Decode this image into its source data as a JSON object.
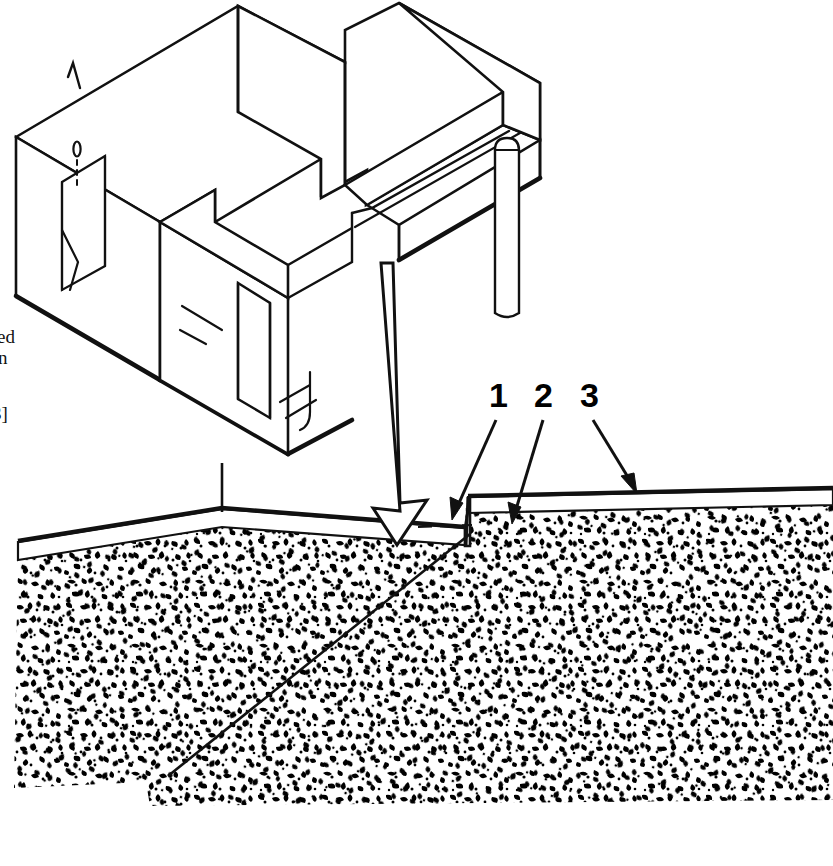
{
  "figure": {
    "line_color": "#111111",
    "fill_color": "#ffffff",
    "soil_color": "#000000",
    "background": "#ffffff"
  },
  "callouts": [
    {
      "id": "callout-1",
      "label": "1",
      "x": 497,
      "y": 392,
      "target": "under-slab base course / fill"
    },
    {
      "id": "callout-2",
      "label": "2",
      "x": 543,
      "y": 392,
      "target": "slab step riser"
    },
    {
      "id": "callout-3",
      "label": "3",
      "x": 589,
      "y": 392,
      "target": "upper slab surface"
    }
  ],
  "margin_text": [
    {
      "id": "margin-text-1",
      "value": "ed",
      "x": -3,
      "y": 334
    },
    {
      "id": "margin-text-2",
      "value": "n",
      "x": -1,
      "y": 355
    },
    {
      "id": "margin-text-3",
      "value": "3]",
      "x": -6,
      "y": 411
    }
  ],
  "parts": {
    "isometric": {
      "name": "foundation-wall-isometric",
      "features": [
        "perimeter-wall",
        "interior-partition-wall",
        "door-opening-left",
        "door-opening-front",
        "pipe-sleeve",
        "vent-stack-pipe"
      ]
    },
    "section": {
      "name": "slab-on-grade-section",
      "features": [
        "lower-slab",
        "upper-slab",
        "step-riser",
        "soil-fill-texture"
      ]
    },
    "arrow": {
      "name": "placement-arrow",
      "style": "hollow-outline-down"
    }
  }
}
